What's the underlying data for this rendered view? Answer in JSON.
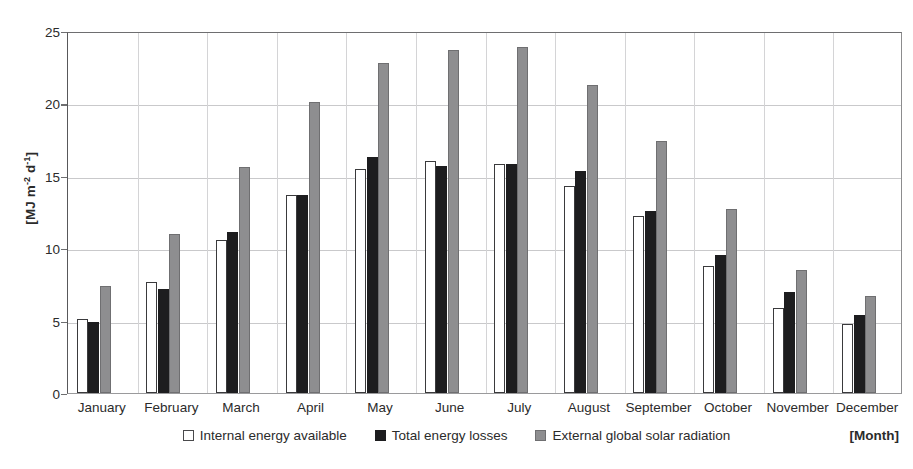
{
  "chart_data": {
    "type": "bar",
    "title": "",
    "subtitle": "",
    "xlabel": "[Month]",
    "ylabel": "[MJ m-2 d-1]",
    "ylabel_parts": {
      "prefix": "[MJ m",
      "sup1": "-2",
      "mid": " d",
      "sup2": "-1",
      "suffix": "]"
    },
    "categories": [
      "January",
      "February",
      "March",
      "April",
      "May",
      "June",
      "July",
      "August",
      "September",
      "October",
      "November",
      "December"
    ],
    "series": [
      {
        "name": "Internal energy available",
        "color": "#ffffff",
        "values": [
          5.1,
          7.7,
          10.6,
          13.7,
          15.5,
          16.0,
          15.8,
          14.3,
          12.2,
          8.8,
          5.9,
          4.8
        ]
      },
      {
        "name": "Total energy losses",
        "color": "#1d1d1f",
        "values": [
          4.9,
          7.2,
          11.1,
          13.7,
          16.3,
          15.7,
          15.8,
          15.3,
          12.6,
          9.5,
          7.0,
          5.4
        ]
      },
      {
        "name": "External global solar radiation",
        "color": "#8e8e90",
        "values": [
          7.4,
          11.0,
          15.6,
          20.1,
          22.8,
          23.7,
          23.9,
          21.3,
          17.4,
          12.7,
          8.5,
          6.7
        ]
      }
    ],
    "ylim": [
      0,
      25
    ],
    "yticks": [
      0,
      5,
      10,
      15,
      20,
      25
    ],
    "grid": true,
    "legend_position": "bottom"
  },
  "axis": {
    "y_title": "[MJ m-2 d-1]",
    "x_title": "[Month]"
  },
  "legend": {
    "items": [
      {
        "label": "Internal energy available"
      },
      {
        "label": "Total energy losses"
      },
      {
        "label": "External global solar radiation"
      }
    ]
  }
}
